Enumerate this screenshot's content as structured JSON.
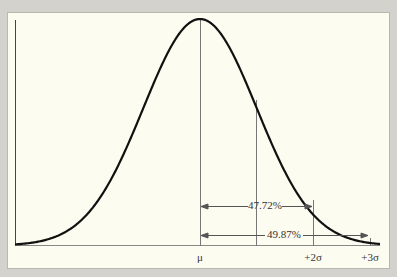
{
  "chart_data": {
    "type": "line",
    "title": "",
    "x_ticks": [
      "μ",
      "+2σ",
      "+3σ"
    ],
    "annotations": [
      {
        "label": "47.72%",
        "from": "μ",
        "to": "+2σ"
      },
      {
        "label": "49.87%",
        "from": "μ",
        "to": "+3σ"
      }
    ],
    "reference_lines": [
      "μ",
      "+1σ",
      "+2σ",
      "+3σ"
    ],
    "grid": false
  },
  "labels": {
    "mu": "μ",
    "plus2sigma": "+2σ",
    "plus3sigma": "+3σ",
    "area_2sigma": "47.72%",
    "area_3sigma": "49.87%"
  },
  "colors": {
    "background": "#d3d2cc",
    "panel": "#fdfcf1",
    "curve": "#111111",
    "lines": "#666666"
  }
}
